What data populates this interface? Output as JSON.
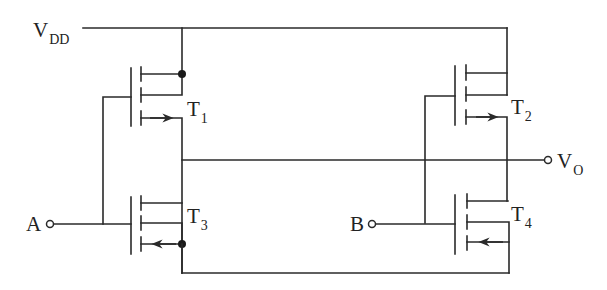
{
  "diagram": {
    "type": "circuit-schematic",
    "stroke_color": "#2a2a2a",
    "supply": {
      "symbol": "V",
      "subscript": "DD"
    },
    "output": {
      "symbol": "V",
      "subscript": "O"
    },
    "inputs": [
      {
        "name": "A"
      },
      {
        "name": "B"
      }
    ],
    "transistors": [
      {
        "id": "T1",
        "symbol": "T",
        "subscript": "1",
        "arrow": "right"
      },
      {
        "id": "T2",
        "symbol": "T",
        "subscript": "2",
        "arrow": "right"
      },
      {
        "id": "T3",
        "symbol": "T",
        "subscript": "3",
        "arrow": "left"
      },
      {
        "id": "T4",
        "symbol": "T",
        "subscript": "4",
        "arrow": "left"
      }
    ]
  }
}
